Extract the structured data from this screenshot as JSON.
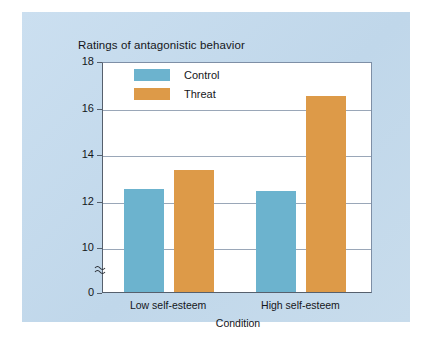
{
  "chart_data": {
    "type": "bar",
    "title": "Ratings of antagonistic behavior",
    "xlabel": "Condition",
    "ylabel": "",
    "categories": [
      "Low self-esteem",
      "High self-esteem"
    ],
    "series": [
      {
        "name": "Control",
        "color": "#6cb3ce",
        "values": [
          12.5,
          12.4
        ]
      },
      {
        "name": "Threat",
        "color": "#dd9a48",
        "values": [
          13.3,
          16.5
        ]
      }
    ],
    "ylim": [
      0,
      18
    ],
    "yticks": [
      0,
      10,
      12,
      14,
      16,
      18
    ],
    "ytick_labels": [
      "0",
      "10",
      "12",
      "14",
      "16",
      "18"
    ],
    "axis_break": true,
    "axis_break_symbol": "≈",
    "grid": true,
    "grid_axis": "y",
    "legend_position": "top-center",
    "background_color": "#c6dbec",
    "plot_background_color": "#ffffff"
  },
  "legend": {
    "items": [
      {
        "label": "Control"
      },
      {
        "label": "Threat"
      }
    ]
  },
  "axes": {
    "y_tick_labels": [
      "18",
      "16",
      "14",
      "12",
      "10",
      "0"
    ],
    "x_tick_labels": [
      "Low self-esteem",
      "High self-esteem"
    ],
    "x_title": "Condition",
    "break_symbol": "≈"
  },
  "title": "Ratings of antagonistic behavior"
}
